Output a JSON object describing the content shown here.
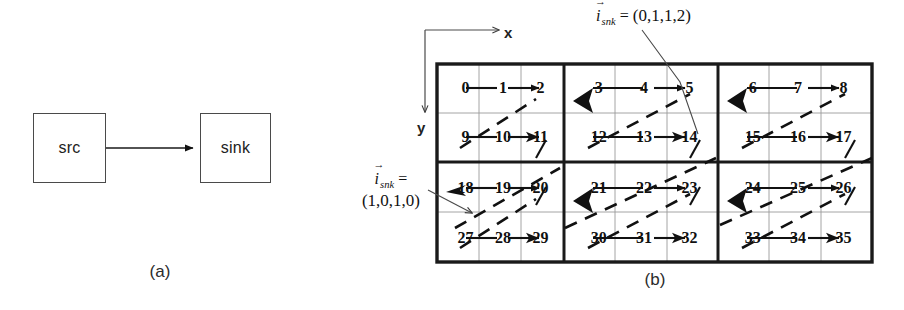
{
  "figure": {
    "panels": [
      {
        "id": "a",
        "caption": "(a)"
      },
      {
        "id": "b",
        "caption": "(b)"
      }
    ]
  },
  "panel_a": {
    "caption": "(a)",
    "nodes": [
      {
        "name": "src",
        "label": "src"
      },
      {
        "name": "sink",
        "label": "sink"
      }
    ],
    "edge": {
      "from": "src",
      "to": "sink",
      "style": "solid",
      "arrow": "end"
    }
  },
  "panel_b": {
    "caption": "(b)",
    "axes": {
      "x_label": "x",
      "y_label": "y",
      "origin": "top-left"
    },
    "annotations": [
      {
        "name": "annot-top",
        "symbol": "i",
        "subscript": "snk",
        "equals": "=",
        "value": "(0,1,1,2)",
        "text": "i_snk = (0,1,1,2)",
        "points_to_cell": 14
      },
      {
        "name": "annot-left",
        "symbol": "i",
        "subscript": "snk",
        "equals": "=",
        "value": "(1,0,1,0)",
        "text": "i_snk = (1,0,1,0)",
        "points_to_cell": 27
      }
    ],
    "grid": {
      "blocks_cols": 3,
      "blocks_rows": 2,
      "cells_per_block_cols": 3,
      "cells_per_block_rows": 2,
      "total_cells": 36,
      "numbering_start": 0,
      "blocks": [
        {
          "index": 0,
          "cells": [
            [
              0,
              1,
              2
            ],
            [
              9,
              10,
              11
            ]
          ]
        },
        {
          "index": 1,
          "cells": [
            [
              3,
              4,
              5
            ],
            [
              12,
              13,
              14
            ]
          ]
        },
        {
          "index": 2,
          "cells": [
            [
              6,
              7,
              8
            ],
            [
              15,
              16,
              17
            ]
          ]
        },
        {
          "index": 3,
          "cells": [
            [
              18,
              19,
              20
            ],
            [
              27,
              28,
              29
            ]
          ]
        },
        {
          "index": 4,
          "cells": [
            [
              21,
              22,
              23
            ],
            [
              30,
              31,
              32
            ]
          ]
        },
        {
          "index": 5,
          "cells": [
            [
              24,
              25,
              26
            ],
            [
              33,
              34,
              35
            ]
          ]
        }
      ],
      "cell_numbers": [
        "0",
        "1",
        "2",
        "3",
        "4",
        "5",
        "6",
        "7",
        "8",
        "9",
        "10",
        "11",
        "12",
        "13",
        "14",
        "15",
        "16",
        "17",
        "18",
        "19",
        "20",
        "21",
        "22",
        "23",
        "24",
        "25",
        "26",
        "27",
        "28",
        "29",
        "30",
        "31",
        "32",
        "33",
        "34",
        "35"
      ]
    },
    "legend": {
      "solid_arrow": "intra-row dependence",
      "dashed_arrow": "diagonal cross-block dependence"
    }
  },
  "colors": {
    "ink": "#111111",
    "box_stroke": "#4a4a4a",
    "grid_outer": "#1a1a1a",
    "grid_inner": "#8a8a8a",
    "background": "#ffffff"
  }
}
